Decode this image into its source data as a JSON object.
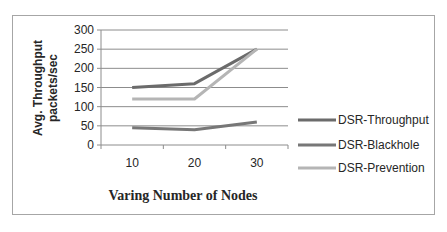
{
  "chart_data": {
    "type": "line",
    "title": "",
    "xlabel": "Varing Number of Nodes",
    "ylabel": "Avg. Throughput packets/sec",
    "ylabel_lines": [
      "Avg. Throughput",
      "packets/sec"
    ],
    "categories": [
      "10",
      "20",
      "30"
    ],
    "y_ticks": [
      "0",
      "50",
      "100",
      "150",
      "200",
      "250",
      "300"
    ],
    "ylim": [
      0,
      300
    ],
    "grid": true,
    "legend_position": "right",
    "series": [
      {
        "name": "DSR-Throughput",
        "values": [
          150,
          160,
          250
        ],
        "color": "#6b6b6b"
      },
      {
        "name": "DSR-Blackhole",
        "values": [
          45,
          40,
          60
        ],
        "color": "#777777"
      },
      {
        "name": "DSR-Prevention",
        "values": [
          120,
          120,
          250
        ],
        "color": "#b5b5b5"
      }
    ]
  }
}
